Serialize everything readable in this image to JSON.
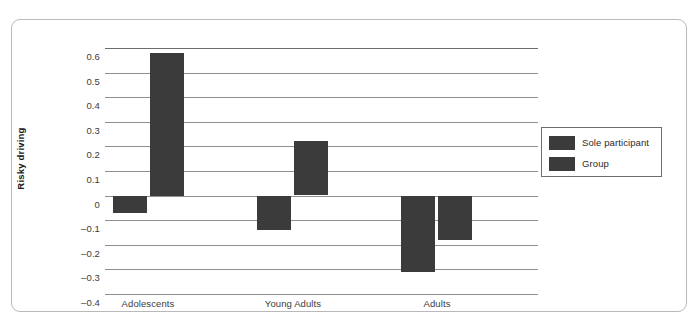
{
  "chart_data": {
    "type": "bar",
    "title": "",
    "xlabel": "",
    "ylabel": "Risky driving",
    "ylim": [
      -0.4,
      0.6
    ],
    "ytick_step": 0.1,
    "grid": true,
    "legend_position": "right",
    "categories": [
      "Adolescents",
      "Young Adults",
      "Adults"
    ],
    "ytick_labels": [
      "0.6",
      "0.5",
      "0.4",
      "0.3",
      "0.2",
      "0.1",
      "0",
      "–0.1",
      "–0.2",
      "–0.3",
      "–0.4"
    ],
    "ytick_values": [
      0.6,
      0.5,
      0.4,
      0.3,
      0.2,
      0.1,
      0,
      -0.1,
      -0.2,
      -0.3,
      -0.4
    ],
    "series": [
      {
        "name": "Sole participant",
        "color": "#3b3b3b",
        "values": [
          -0.07,
          -0.14,
          -0.31
        ]
      },
      {
        "name": "Group",
        "color": "#3b3b3b",
        "values": [
          0.58,
          0.22,
          -0.18
        ]
      }
    ]
  },
  "legend": {
    "items": [
      {
        "label": "Sole participant",
        "color": "#3b3b3b"
      },
      {
        "label": "Group",
        "color": "#3b3b3b"
      }
    ]
  },
  "axis": {
    "y_title": "Risky driving"
  },
  "colors": {
    "bar": "#3b3b3b",
    "gridline": "#8f8f8f",
    "frame": "#b9b9b9",
    "text": "#3c3c3c"
  }
}
